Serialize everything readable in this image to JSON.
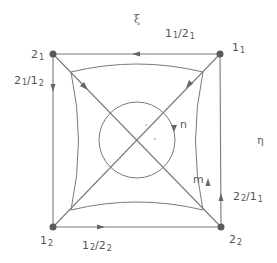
{
  "diagram": {
    "axis_labels": {
      "xi": "ξ",
      "eta": "η"
    },
    "vertices": [
      {
        "id": "top-left",
        "main": "2",
        "sub": "1"
      },
      {
        "id": "top-right",
        "main": "1",
        "sub": "1"
      },
      {
        "id": "bottom-right",
        "main": "2",
        "sub": "2"
      },
      {
        "id": "bottom-left",
        "main": "1",
        "sub": "2"
      }
    ],
    "edges": [
      {
        "id": "top",
        "num_main": "1",
        "num_sub": "1",
        "den_main": "2",
        "den_sub": "1",
        "direction": "left"
      },
      {
        "id": "left",
        "num_main": "2",
        "num_sub": "1",
        "den_main": "1",
        "den_sub": "2",
        "direction": "down"
      },
      {
        "id": "bottom",
        "num_main": "1",
        "num_sub": "2",
        "den_main": "2",
        "den_sub": "2",
        "direction": "right"
      },
      {
        "id": "right",
        "num_main": "2",
        "num_sub": "2",
        "den_main": "1",
        "den_sub": "1",
        "direction": "up"
      }
    ],
    "loop_labels": {
      "circle": "n",
      "inner_curve": "m"
    },
    "slash": "/"
  }
}
